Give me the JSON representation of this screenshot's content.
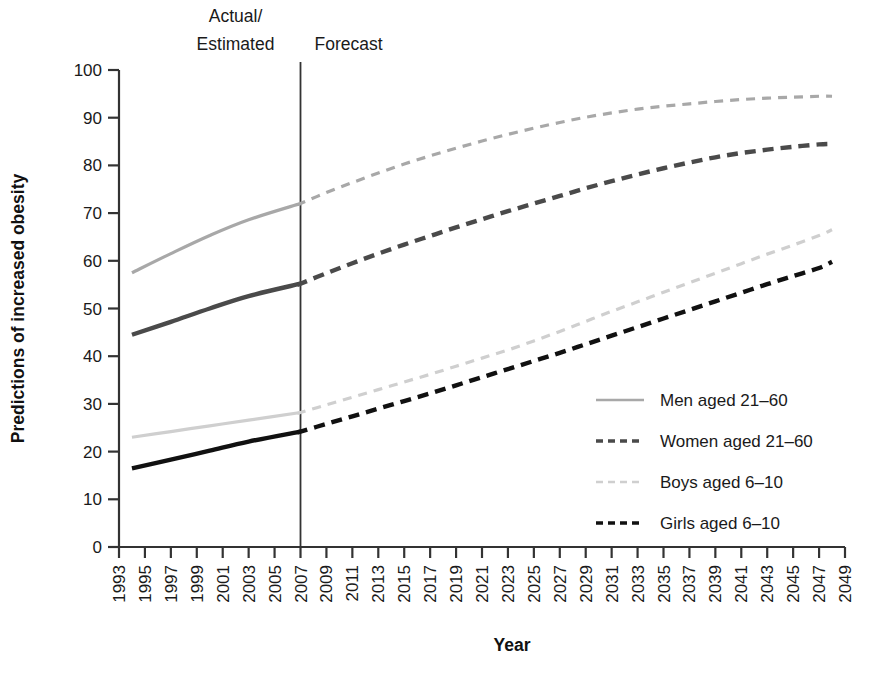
{
  "chart_data": {
    "type": "line",
    "title": "",
    "xlabel": "Year",
    "ylabel": "Predictions of increased obesity",
    "xlim": [
      1993,
      2049
    ],
    "ylim": [
      0,
      100
    ],
    "grid": false,
    "legend_position": "center-right inside plot",
    "y_ticks": [
      0,
      10,
      20,
      30,
      40,
      50,
      60,
      70,
      80,
      90,
      100
    ],
    "x_ticks": [
      1993,
      1995,
      1997,
      1999,
      2001,
      2003,
      2005,
      2007,
      2009,
      2011,
      2013,
      2015,
      2017,
      2019,
      2021,
      2023,
      2025,
      2027,
      2029,
      2031,
      2033,
      2035,
      2037,
      2039,
      2041,
      2043,
      2045,
      2047,
      2049
    ],
    "annotations": [
      {
        "name": "actual-estimated-label",
        "text": "Actual/\nEstimated",
        "line1": "Actual/",
        "line2": "Estimated",
        "at_x": 2000
      },
      {
        "name": "forecast-label",
        "text": "Forecast",
        "at_x": 2012
      },
      {
        "name": "divider",
        "text": "",
        "at_x": 2007,
        "kind": "vertical-line"
      }
    ],
    "split_year": 2007,
    "series": [
      {
        "name": "Men aged 21–60",
        "legend_label": "Men aged 21–60",
        "color": "#a8a8a8",
        "style_actual": "solid",
        "style_forecast": "dashed",
        "x": [
          1994,
          1997,
          2000,
          2003,
          2007,
          2009,
          2011,
          2013,
          2015,
          2017,
          2019,
          2021,
          2023,
          2025,
          2027,
          2029,
          2031,
          2033,
          2035,
          2037,
          2039,
          2041,
          2043,
          2045,
          2047,
          2048
        ],
        "values": [
          57.5,
          61.5,
          65.3,
          68.6,
          72.0,
          74.3,
          76.4,
          78.4,
          80.3,
          82.0,
          83.6,
          85.1,
          86.5,
          87.8,
          89.0,
          90.1,
          91.0,
          91.8,
          92.4,
          92.9,
          93.4,
          93.8,
          94.1,
          94.3,
          94.5,
          94.5
        ]
      },
      {
        "name": "Women aged 21–60",
        "legend_label": "Women aged 21–60",
        "color": "#4a4a4a",
        "style_actual": "solid",
        "style_forecast": "dashed",
        "x": [
          1994,
          1997,
          2000,
          2003,
          2007,
          2009,
          2011,
          2013,
          2015,
          2017,
          2019,
          2021,
          2023,
          2025,
          2027,
          2029,
          2031,
          2033,
          2035,
          2037,
          2039,
          2041,
          2043,
          2045,
          2047,
          2048
        ],
        "values": [
          44.5,
          47.2,
          50.0,
          52.6,
          55.2,
          57.4,
          59.5,
          61.5,
          63.4,
          65.2,
          67.0,
          68.7,
          70.4,
          72.0,
          73.6,
          75.2,
          76.7,
          78.1,
          79.4,
          80.6,
          81.7,
          82.6,
          83.3,
          83.9,
          84.4,
          84.5
        ]
      },
      {
        "name": "Boys aged 6–10",
        "legend_label": "Boys aged 6–10",
        "color": "#cfcfcf",
        "style_actual": "solid",
        "style_forecast": "dashed",
        "x": [
          1994,
          1997,
          2000,
          2003,
          2007,
          2009,
          2011,
          2013,
          2015,
          2017,
          2019,
          2021,
          2023,
          2025,
          2027,
          2029,
          2031,
          2033,
          2035,
          2037,
          2039,
          2041,
          2043,
          2045,
          2047,
          2048
        ],
        "values": [
          23.0,
          24.2,
          25.4,
          26.6,
          28.2,
          29.8,
          31.4,
          33.0,
          34.6,
          36.2,
          37.9,
          39.6,
          41.3,
          43.2,
          45.2,
          47.3,
          49.4,
          51.4,
          53.4,
          55.4,
          57.4,
          59.4,
          61.4,
          63.3,
          65.3,
          66.5
        ]
      },
      {
        "name": "Girls aged 6–10",
        "legend_label": "Girls aged 6–10",
        "color": "#111111",
        "style_actual": "solid",
        "style_forecast": "dashed",
        "x": [
          1994,
          1997,
          2000,
          2003,
          2007,
          2009,
          2011,
          2013,
          2015,
          2017,
          2019,
          2021,
          2023,
          2025,
          2027,
          2029,
          2031,
          2033,
          2035,
          2037,
          2039,
          2041,
          2043,
          2045,
          2047,
          2048
        ],
        "values": [
          16.5,
          18.3,
          20.2,
          22.1,
          24.2,
          25.8,
          27.4,
          29.0,
          30.6,
          32.2,
          33.9,
          35.6,
          37.3,
          39.0,
          40.7,
          42.5,
          44.3,
          46.1,
          47.9,
          49.7,
          51.5,
          53.3,
          55.1,
          56.8,
          58.5,
          59.8
        ]
      }
    ]
  },
  "axis": {
    "y_title": "Predictions of increased obesity",
    "x_title": "Year"
  },
  "annotations": {
    "actual_estimated_line1": "Actual/",
    "actual_estimated_line2": "Estimated",
    "forecast": "Forecast"
  },
  "legend": {
    "items": [
      {
        "label": "Men aged 21–60",
        "color": "#a8a8a8",
        "dash": "1,0"
      },
      {
        "label": "Women aged 21–60",
        "color": "#4a4a4a",
        "dash": "7,5"
      },
      {
        "label": "Boys aged 6–10",
        "color": "#cfcfcf",
        "dash": "7,5"
      },
      {
        "label": "Girls aged 6–10",
        "color": "#111111",
        "dash": "7,5"
      }
    ]
  },
  "ticks": {
    "y": [
      "0",
      "10",
      "20",
      "30",
      "40",
      "50",
      "60",
      "70",
      "80",
      "90",
      "100"
    ],
    "x": [
      "1993",
      "1995",
      "1997",
      "1999",
      "2001",
      "2003",
      "2005",
      "2007",
      "2009",
      "2011",
      "2013",
      "2015",
      "2017",
      "2019",
      "2021",
      "2023",
      "2025",
      "2027",
      "2029",
      "2031",
      "2033",
      "2035",
      "2037",
      "2039",
      "2041",
      "2043",
      "2045",
      "2047",
      "2049"
    ]
  }
}
